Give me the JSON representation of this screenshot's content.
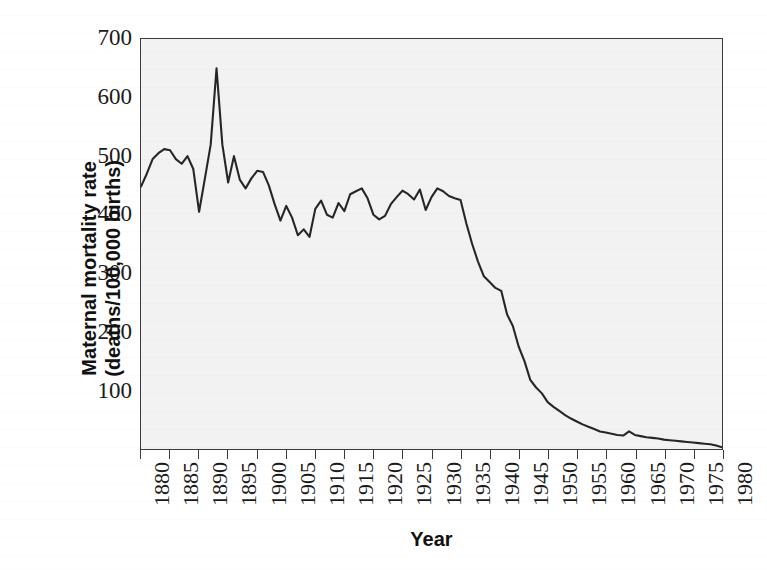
{
  "chart_data": {
    "type": "line",
    "title": "",
    "xlabel": "Year",
    "ylabel": "Maternal mortality rate (deaths/100,000 births)",
    "ylabel_line1": "Maternal mortality rate",
    "ylabel_line2": "(deaths/100,000 births)",
    "xlim": [
      1880,
      1980
    ],
    "ylim": [
      0,
      700
    ],
    "grid": false,
    "legend": "none",
    "y_ticks": [
      700,
      600,
      500,
      400,
      300,
      200,
      100
    ],
    "x_ticks": [
      1880,
      1885,
      1890,
      1895,
      1900,
      1905,
      1910,
      1915,
      1920,
      1925,
      1930,
      1935,
      1940,
      1945,
      1950,
      1955,
      1960,
      1965,
      1970,
      1975,
      1980
    ],
    "series": [
      {
        "name": "Maternal mortality rate",
        "color": "#262626",
        "x": [
          1880,
          1881,
          1882,
          1883,
          1884,
          1885,
          1886,
          1887,
          1888,
          1889,
          1890,
          1891,
          1892,
          1893,
          1894,
          1895,
          1896,
          1897,
          1898,
          1899,
          1900,
          1901,
          1902,
          1903,
          1904,
          1905,
          1906,
          1907,
          1908,
          1909,
          1910,
          1911,
          1912,
          1913,
          1914,
          1915,
          1916,
          1917,
          1918,
          1919,
          1920,
          1921,
          1922,
          1923,
          1924,
          1925,
          1926,
          1927,
          1928,
          1929,
          1930,
          1931,
          1932,
          1933,
          1934,
          1935,
          1936,
          1937,
          1938,
          1939,
          1940,
          1941,
          1942,
          1943,
          1944,
          1945,
          1946,
          1947,
          1948,
          1949,
          1950,
          1951,
          1952,
          1953,
          1954,
          1955,
          1956,
          1957,
          1958,
          1959,
          1960,
          1961,
          1962,
          1963,
          1964,
          1965,
          1966,
          1967,
          1968,
          1969,
          1970,
          1971,
          1972,
          1973,
          1974,
          1975,
          1976,
          1977,
          1978,
          1979,
          1980
        ],
        "values": [
          448,
          470,
          495,
          505,
          512,
          510,
          495,
          487,
          500,
          478,
          405,
          462,
          520,
          650,
          520,
          455,
          500,
          460,
          445,
          462,
          475,
          473,
          450,
          418,
          390,
          415,
          395,
          365,
          375,
          362,
          410,
          424,
          400,
          395,
          420,
          406,
          435,
          440,
          445,
          428,
          400,
          392,
          398,
          418,
          430,
          441,
          435,
          426,
          443,
          408,
          430,
          445,
          440,
          432,
          428,
          425,
          385,
          350,
          320,
          295,
          285,
          275,
          270,
          230,
          210,
          175,
          150,
          118,
          105,
          95,
          80,
          72,
          65,
          58,
          52,
          47,
          42,
          38,
          34,
          30,
          28,
          26,
          24,
          23,
          30,
          24,
          22,
          20,
          19,
          18,
          16,
          15,
          14,
          13,
          12,
          11,
          10,
          9,
          8,
          6,
          3
        ]
      }
    ]
  },
  "axes": {
    "y_title_line1": "Maternal mortality rate",
    "y_title_line2": "(deaths/100,000 births)",
    "x_title": "Year"
  }
}
